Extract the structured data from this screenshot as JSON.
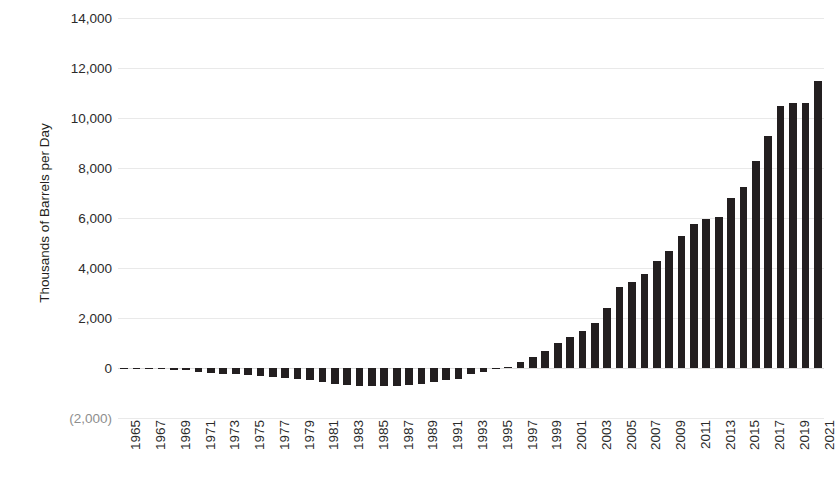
{
  "chart_data": {
    "type": "bar",
    "title": "",
    "subtitle": "",
    "xlabel": "",
    "ylabel": "Thousands of Barrels per Day",
    "ylim": [
      -2000,
      14000
    ],
    "ytick_values": [
      14000,
      12000,
      10000,
      8000,
      6000,
      4000,
      2000,
      0,
      -2000
    ],
    "ytick_labels": [
      "14,000",
      "12,000",
      "10,000",
      "8,000",
      "6,000",
      "4,000",
      "2,000",
      "0",
      "(2,000)"
    ],
    "grid": true,
    "legend": null,
    "legend_position": "none",
    "bar_color": "#231f20",
    "x_tick_step": 2,
    "xtick_labels": [
      "1965",
      "1967",
      "1969",
      "1971",
      "1973",
      "1975",
      "1977",
      "1979",
      "1981",
      "1983",
      "1985",
      "1987",
      "1989",
      "1991",
      "1993",
      "1995",
      "1997",
      "1999",
      "2001",
      "2003",
      "2005",
      "2007",
      "2009",
      "2011",
      "2013",
      "2015",
      "2017",
      "2019",
      "2021"
    ],
    "categories": [
      "1965",
      "1966",
      "1967",
      "1968",
      "1969",
      "1970",
      "1971",
      "1972",
      "1973",
      "1974",
      "1975",
      "1976",
      "1977",
      "1978",
      "1979",
      "1980",
      "1981",
      "1982",
      "1983",
      "1984",
      "1985",
      "1986",
      "1987",
      "1988",
      "1989",
      "1990",
      "1991",
      "1992",
      "1993",
      "1994",
      "1995",
      "1996",
      "1997",
      "1998",
      "1999",
      "2000",
      "2001",
      "2002",
      "2003",
      "2004",
      "2005",
      "2006",
      "2007",
      "2008",
      "2009",
      "2010",
      "2011",
      "2012",
      "2013",
      "2014",
      "2015",
      "2016",
      "2017",
      "2018",
      "2019",
      "2020",
      "2021"
    ],
    "values": [
      -20,
      -30,
      -40,
      -50,
      -60,
      -70,
      -150,
      -180,
      -230,
      -250,
      -280,
      -320,
      -340,
      -400,
      -430,
      -470,
      -560,
      -620,
      -680,
      -700,
      -720,
      -730,
      -700,
      -660,
      -620,
      -560,
      -480,
      -420,
      -250,
      -150,
      -40,
      60,
      230,
      430,
      700,
      1000,
      1250,
      1500,
      1800,
      2400,
      3250,
      3450,
      3750,
      4300,
      4700,
      5300,
      5750,
      5950,
      6050,
      6800,
      7250,
      8300,
      9300,
      10500,
      10600,
      10600,
      11500
    ]
  }
}
